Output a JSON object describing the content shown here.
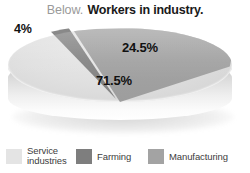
{
  "title": {
    "prefix": "Below.",
    "main": "Workers in industry."
  },
  "chart_data": {
    "type": "pie",
    "title": "Workers in industry.",
    "labels": [
      "Service industries",
      "Manufacturing",
      "Farming"
    ],
    "values": [
      71.5,
      24.5,
      4
    ],
    "value_labels": [
      "71.5%",
      "24.5%",
      "4%"
    ],
    "unit": "%",
    "colors": [
      "#e0e0e0",
      "#a0a0a0",
      "#828282"
    ],
    "exploded": [
      "Farming"
    ],
    "three_d": true,
    "legend_position": "bottom",
    "grid": false,
    "xlabel": "",
    "ylabel": ""
  },
  "legend": {
    "items": [
      {
        "label": "Service industries",
        "color": "#e4e4e4"
      },
      {
        "label": "Farming",
        "color": "#7e7e7e"
      },
      {
        "label": "Manufacturing",
        "color": "#a3a3a3"
      }
    ]
  }
}
